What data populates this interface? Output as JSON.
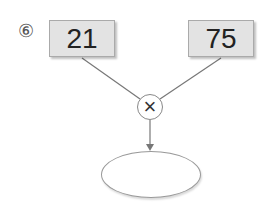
{
  "problem": {
    "number_label": "⑥",
    "left_value": "21",
    "right_value": "75",
    "operator": "×",
    "answer": ""
  }
}
